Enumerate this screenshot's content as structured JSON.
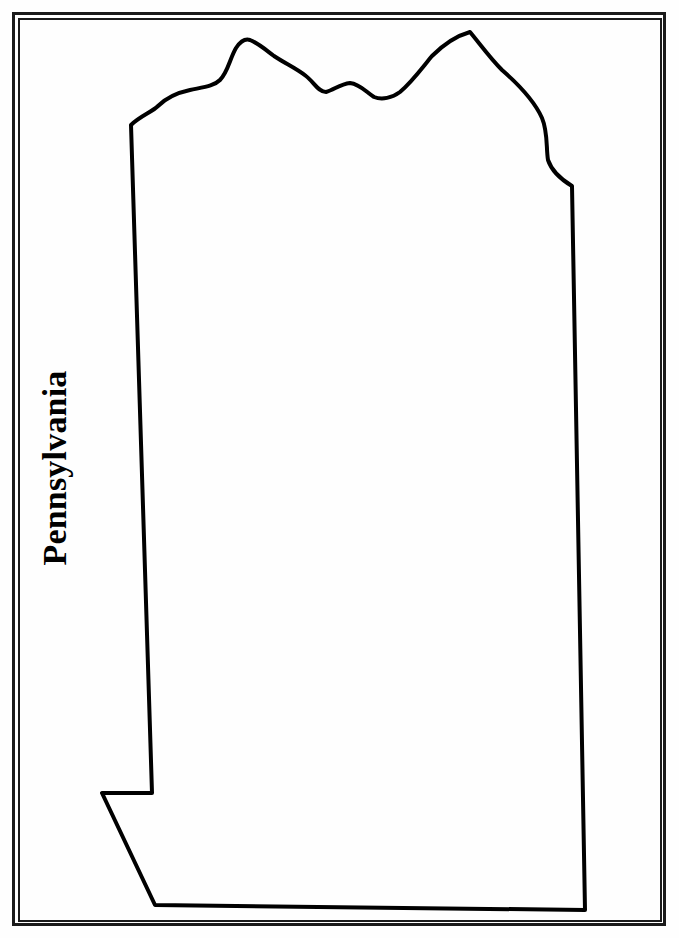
{
  "worksheet": {
    "state_name": "Pennsylvania",
    "outline_color": "#000000",
    "border_color": "#1a1a1a",
    "background_color": "#fefefe"
  }
}
